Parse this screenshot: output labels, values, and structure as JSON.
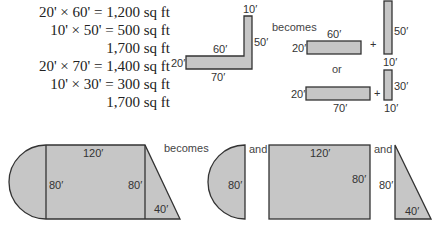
{
  "calculations": [
    "20' × 60' = 1,200 sq ft",
    "10' × 50' = 500 sq ft",
    "1,700 sq ft",
    "20' × 70' = 1,400 sq ft",
    "10' × 30' = 300 sq ft",
    "1,700 sq ft"
  ],
  "l_shape": {
    "top_width": "10′",
    "right_height": "50′",
    "inner_top": "60′",
    "left_height": "20′",
    "bottom_width": "70′"
  },
  "split_a": {
    "rect_top": "60′",
    "rect_left": "20′",
    "plus": "+",
    "bar_height": "50′",
    "bar_width": "10′"
  },
  "split_b": {
    "rect_left": "20′",
    "rect_bottom": "70′",
    "plus": "+",
    "bar_height": "30′",
    "bar_width": "10′"
  },
  "words": {
    "becomes_top": "becomes",
    "or": "or",
    "becomes_bottom": "becomes",
    "and_1": "and",
    "and_2": "and"
  },
  "composite": {
    "top": "120′",
    "left": "80′",
    "right": "80′",
    "triangle_base": "40′"
  },
  "parts": {
    "semicircle": "80′",
    "rect_top": "120′",
    "rect_right": "80′",
    "triangle_height": "80′",
    "triangle_base": "40′"
  }
}
